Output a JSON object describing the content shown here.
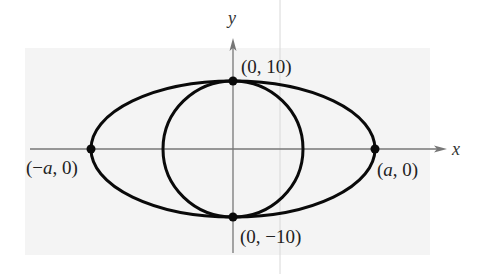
{
  "figure": {
    "background_panel_color": "#f4f4f4",
    "stroke_color": "#0a0a0a",
    "axis_color": "#777777"
  },
  "axes": {
    "x_label": "x",
    "y_label": "y"
  },
  "points": {
    "top": {
      "label": "(0, 10)",
      "x": 0,
      "y": 10
    },
    "bottom": {
      "label": "(0, −10)",
      "x": 0,
      "y": -10
    },
    "left": {
      "label": "(−a, 0)",
      "x": "-a",
      "y": 0
    },
    "right": {
      "label": "(a, 0)",
      "x": "a",
      "y": 0
    }
  },
  "label_parts": {
    "left_open": "(−",
    "left_var": "a",
    "left_close": ", 0)",
    "right_open": "(",
    "right_var": "a",
    "right_close": ", 0)"
  },
  "shapes": {
    "ellipse": {
      "center": [
        0,
        0
      ],
      "semi_major": "a",
      "semi_minor": 10
    },
    "circle": {
      "center": [
        0,
        0
      ],
      "radius": 10
    }
  }
}
